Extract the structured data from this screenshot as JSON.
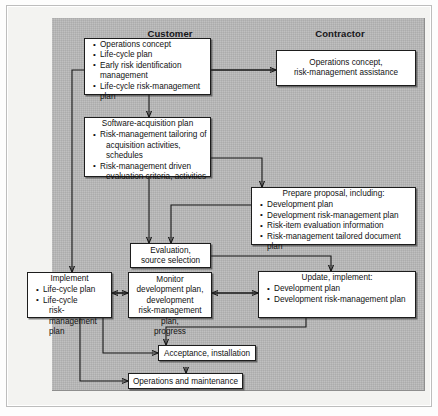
{
  "figure": {
    "headers": {
      "customer": "Customer",
      "contractor": "Contractor"
    },
    "colors": {
      "panel": "#b9b9b9",
      "box_fill": "#ffffff",
      "line": "#161616",
      "text": "#111111"
    }
  },
  "boxes": {
    "customer_concept": {
      "items": [
        "Operations concept",
        "Life-cycle plan",
        "Early risk identification management",
        "Life-cycle risk-management plan"
      ]
    },
    "contractor_concept": {
      "line1": "Operations concept,",
      "line2": "risk-management assistance"
    },
    "software_acquisition": {
      "title": "Software-acquisition plan",
      "items": [
        {
          "line1": "Risk-management tailoring of",
          "line2": "acquisition activities, schedules"
        },
        {
          "line1": "Risk-management driven",
          "line2": "evaluation criteria, activities"
        }
      ]
    },
    "prepare_proposal": {
      "title": "Prepare proposal, including:",
      "items": [
        "Development plan",
        "Development risk-management plan",
        "Risk-item evaluation information",
        "Risk-management tailored document plan"
      ]
    },
    "evaluation": {
      "line1": "Evaluation,",
      "line2": "source selection"
    },
    "implement": {
      "title": "Implement",
      "items": [
        {
          "line1": "Life-cycle plan",
          "line2": ""
        },
        {
          "line1": "Life-cycle",
          "line2": "risk-management plan"
        }
      ]
    },
    "monitor": {
      "line1": "Monitor development plan,",
      "line2": "development",
      "line3": "risk-management plan,",
      "line4": "progress"
    },
    "update": {
      "title": "Update, implement:",
      "items": [
        "Development plan",
        "Development risk-management plan"
      ]
    },
    "acceptance": {
      "label": "Acceptance, installation"
    },
    "operations": {
      "label": "Operations and maintenance"
    }
  }
}
